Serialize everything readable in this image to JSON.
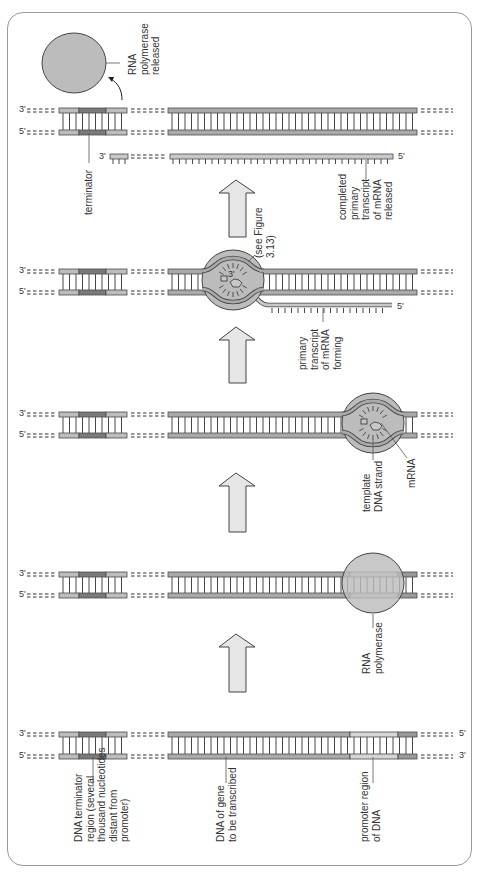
{
  "figure": {
    "orientation": "stages stacked bottom-to-top, DNA horizontal, labels rotated -90deg",
    "colors": {
      "strand": "#a9a9a9",
      "strand_outline": "#4a4a4a",
      "terminator_light": "#bdbdbd",
      "terminator_dark": "#7a7a7a",
      "promoter": "#d6d6d6",
      "promoter_end": "#9a9a9a",
      "rna": "#c8c8c8",
      "polymerase": "#bcbcbc",
      "arrow_fill": "#e6e6e6",
      "frame": "#9a9a9a",
      "text": "#333333"
    }
  },
  "ends": {
    "three": "3'",
    "five": "5'"
  },
  "stages": [
    {
      "id": "stage-1",
      "title": "DNA with promoter and terminator",
      "y_top": 732,
      "y_bot": 754,
      "labels": [
        {
          "name": "dna-terminator-region-label",
          "lines": [
            "DNA terminator",
            "region (several",
            "thousand nucleotides",
            "distant from",
            "promoter)"
          ],
          "x": 82,
          "y": 842,
          "lead": [
            93,
            757,
            93,
            785
          ]
        },
        {
          "name": "dna-of-gene-label",
          "lines": [
            "DNA of gene",
            "to be transcribed"
          ],
          "x": 224,
          "y": 842,
          "lead": [
            226,
            757,
            226,
            783
          ]
        },
        {
          "name": "promoter-region-label",
          "lines": [
            "promoter region",
            "of DNA"
          ],
          "x": 368,
          "y": 842,
          "lead": [
            373,
            757,
            373,
            783
          ]
        }
      ],
      "left_end_top": "3'",
      "left_end_bot": "5'",
      "right_end_top": "5'",
      "right_end_bot": "3'"
    },
    {
      "id": "stage-2",
      "title": "RNA polymerase binds promoter",
      "y_top": 572,
      "y_bot": 593,
      "labels": [
        {
          "name": "rna-polymerase-label",
          "lines": [
            "RNA",
            "polymerase"
          ],
          "x": 370,
          "y": 674,
          "lead": [
            373,
            614,
            373,
            628
          ]
        }
      ],
      "left_end_top": "3'",
      "left_end_bot": "5'"
    },
    {
      "id": "stage-3",
      "title": "DNA unwinds; mRNA begins",
      "y_top": 412,
      "y_bot": 433,
      "labels": [
        {
          "name": "template-dna-strand-label",
          "lines": [
            "template",
            "DNA strand"
          ],
          "x": 370,
          "y": 512,
          "lead": [
            373,
            440,
            373,
            460
          ]
        },
        {
          "name": "mrna-label",
          "lines": [
            "mRNA"
          ],
          "x": 415,
          "y": 488,
          "lead": [
            381,
            423,
            407,
            458
          ]
        }
      ],
      "left_end_top": "3'",
      "left_end_bot": "5'"
    },
    {
      "id": "stage-4",
      "title": "Elongation",
      "y_top": 269,
      "y_bot": 290,
      "labels": [
        {
          "name": "see-figure-label",
          "lines": [
            "(see Figure",
            "3.13)"
          ],
          "x": 262,
          "y": 258,
          "lead": [
            255,
            255,
            248,
            262
          ]
        },
        {
          "name": "primary-transcript-forming-label",
          "lines": [
            "primary",
            "transcript",
            "of mRNA",
            "forming"
          ],
          "x": 306,
          "y": 370,
          "lead": [
            323,
            308,
            323,
            322
          ]
        }
      ],
      "mrna_end": "5'",
      "inner_end": "3'",
      "left_end_top": "3'",
      "left_end_bot": "5'"
    },
    {
      "id": "stage-5",
      "title": "Termination",
      "y_top": 108,
      "y_bot": 130,
      "labels": [
        {
          "name": "terminator-label",
          "lines": [
            "terminator"
          ],
          "x": 92,
          "y": 215,
          "lead": [
            89,
            133,
            89,
            163
          ]
        },
        {
          "name": "completed-transcript-label",
          "lines": [
            "completed",
            "primary",
            "transcript",
            "of mRNA",
            "released"
          ],
          "x": 346,
          "y": 220,
          "lead": [
            366,
            160,
            366,
            182
          ]
        },
        {
          "name": "rna-polymerase-released-label",
          "lines": [
            "RNA",
            "polymerase",
            "released"
          ],
          "x": 136,
          "y": 75,
          "lead": [
            106,
            63,
            120,
            63
          ]
        }
      ],
      "rna_end_left": "3'",
      "rna_end_right": "5'",
      "left_end_top": "3'",
      "left_end_bot": "5'"
    }
  ],
  "arrows": [
    {
      "name": "step-arrow-1-to-2",
      "tip": 634,
      "base": 692
    },
    {
      "name": "step-arrow-2-to-3",
      "tip": 473,
      "base": 532
    },
    {
      "name": "step-arrow-3-to-4",
      "tip": 327,
      "base": 383
    },
    {
      "name": "step-arrow-4-to-5",
      "tip": 180,
      "base": 237
    }
  ]
}
